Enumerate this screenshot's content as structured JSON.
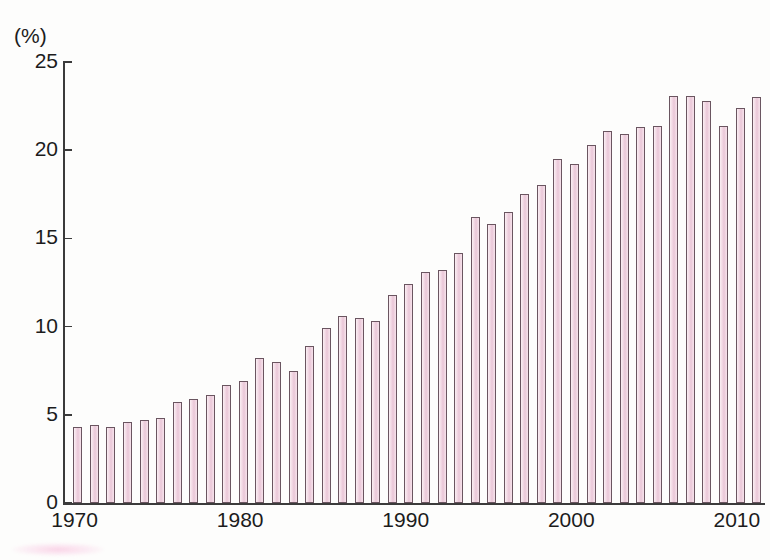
{
  "chart_data": {
    "type": "bar",
    "title": "",
    "subtitle": "",
    "xlabel": "",
    "ylabel": "",
    "unit_label": "(%)",
    "grid": false,
    "legend": null,
    "xlim": [
      1969.3,
      2011.7
    ],
    "ylim": [
      0,
      25
    ],
    "y_ticks": [
      0,
      5,
      10,
      15,
      20,
      25
    ],
    "y_tick_labels": [
      "0",
      "5",
      "10",
      "15",
      "20",
      "25"
    ],
    "x_ticks": [
      1970,
      1980,
      1990,
      2000,
      2010
    ],
    "x_tick_labels": [
      "1970",
      "1980",
      "1990",
      "2000",
      "2010"
    ],
    "x_minor_tick_interval": 1,
    "bar_fill_color": "#f3dbe6",
    "bar_edge_color": "#6a5560",
    "axis_color": "#3b3b3b",
    "categories": [
      1970,
      1971,
      1972,
      1973,
      1974,
      1975,
      1976,
      1977,
      1978,
      1979,
      1980,
      1981,
      1982,
      1983,
      1984,
      1985,
      1986,
      1987,
      1988,
      1989,
      1990,
      1991,
      1992,
      1993,
      1994,
      1995,
      1996,
      1997,
      1998,
      1999,
      2000,
      2001,
      2002,
      2003,
      2004,
      2005,
      2006,
      2007,
      2008,
      2009,
      2010,
      2011
    ],
    "values": [
      4.3,
      4.4,
      4.3,
      4.6,
      4.7,
      4.8,
      5.7,
      5.9,
      6.1,
      6.7,
      6.9,
      8.2,
      8.0,
      7.5,
      8.9,
      9.9,
      10.6,
      10.5,
      10.3,
      11.8,
      12.4,
      13.1,
      13.2,
      14.2,
      16.2,
      15.8,
      16.5,
      17.5,
      18.0,
      19.5,
      19.2,
      20.3,
      21.1,
      20.9,
      21.3,
      21.4,
      23.1,
      23.1,
      22.8,
      21.4,
      22.4,
      23.0
    ]
  }
}
